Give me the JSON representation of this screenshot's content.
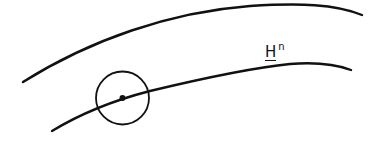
{
  "diagram": {
    "label": {
      "main": "H",
      "superscript": "n",
      "underlined": true
    },
    "elements": [
      {
        "type": "curve",
        "name": "upper-boundary-curve"
      },
      {
        "type": "curve",
        "name": "hypersurface-curve",
        "labeled": "H^n"
      },
      {
        "type": "circle",
        "name": "neighborhood-circle"
      },
      {
        "type": "point",
        "name": "center-point"
      }
    ],
    "colors": {
      "stroke": "#111111",
      "background": "#ffffff"
    }
  }
}
